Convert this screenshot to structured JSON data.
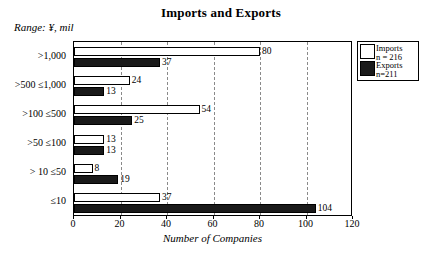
{
  "chart_data": {
    "type": "bar",
    "orientation": "horizontal",
    "title": "Imports and Exports",
    "subtitle": "Range: ¥, mil",
    "xlabel": "Number of Companies",
    "ylabel": "",
    "xlim": [
      0,
      120
    ],
    "xticks": [
      0,
      20,
      40,
      60,
      80,
      100,
      120
    ],
    "grid": "vertical-dashed",
    "legend_position": "right-outside",
    "categories": [
      ">1,000",
      ">500  ≤1,000",
      ">100  ≤500",
      ">50   ≤100",
      "> 10  ≤50",
      "≤10"
    ],
    "series": [
      {
        "name": "Imports",
        "n_label": "n = 216",
        "color": "#ffffff",
        "values": [
          80,
          24,
          54,
          13,
          8,
          37
        ]
      },
      {
        "name": "Exports",
        "n_label": "n=211",
        "color": "#1a1a1a",
        "values": [
          37,
          13,
          25,
          13,
          19,
          104
        ]
      }
    ]
  },
  "legend": {
    "items": [
      {
        "label": "Imports",
        "n": "n = 216"
      },
      {
        "label": "Exports",
        "n": "n=211"
      }
    ]
  },
  "colors": {
    "imports": "#ffffff",
    "exports": "#1a1a1a",
    "axis": "#000000",
    "grid": "#8a8a8a"
  }
}
